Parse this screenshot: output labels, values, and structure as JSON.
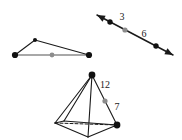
{
  "canvas": {
    "width": 182,
    "height": 140,
    "background": "#ffffff"
  },
  "style": {
    "stroke_color": "#1a1a1a",
    "midpoint_color": "#8c8c8c",
    "vertex_color": "#111111",
    "label_color": "#1a1a1a",
    "stroke_width": 1.1,
    "dash_pattern": "3,2"
  },
  "figures": {
    "triangle": {
      "name": "triangle-with-midpoint",
      "vertices": [
        {
          "name": "left-vertex",
          "x": 15,
          "y": 55
        },
        {
          "name": "apex-vertex",
          "x": 35,
          "y": 40
        },
        {
          "name": "right-vertex",
          "x": 89,
          "y": 55
        }
      ],
      "midpoint": {
        "name": "base-midpoint",
        "x": 52,
        "y": 55
      },
      "base_stroke": "#8c8c8c"
    },
    "arrow_line": {
      "name": "double-headed-line",
      "start": {
        "x": 97,
        "y": 15
      },
      "end": {
        "x": 173,
        "y": 55
      },
      "points": [
        {
          "name": "upper-point",
          "x": 110,
          "y": 22
        },
        {
          "name": "midpoint",
          "x": 125,
          "y": 30
        },
        {
          "name": "lower-point",
          "x": 156,
          "y": 46
        }
      ],
      "labels": [
        {
          "name": "segment-label-3",
          "text": "3",
          "x": 122,
          "y": 20
        },
        {
          "name": "segment-label-6",
          "text": "6",
          "x": 144,
          "y": 37
        }
      ]
    },
    "pyramid": {
      "name": "tetrahedron",
      "apex": {
        "name": "apex-vertex",
        "x": 92,
        "y": 75
      },
      "base": [
        {
          "name": "base-left-vertex",
          "x": 55,
          "y": 123
        },
        {
          "name": "base-front-vertex",
          "x": 88,
          "y": 137
        },
        {
          "name": "base-right-vertex",
          "x": 117,
          "y": 125
        },
        {
          "name": "base-back-vertex",
          "x": 64,
          "y": 121
        }
      ],
      "hidden_edge": {
        "name": "dashed-hidden-edge",
        "from": {
          "x": 55,
          "y": 123
        },
        "to": {
          "x": 117,
          "y": 125
        }
      },
      "midpoint": {
        "name": "edge-midpoint",
        "x": 105,
        "y": 101
      },
      "labels": [
        {
          "name": "edge-label-12",
          "text": "12",
          "x": 105,
          "y": 88
        },
        {
          "name": "edge-label-7",
          "text": "7",
          "x": 117,
          "y": 110
        }
      ]
    }
  }
}
